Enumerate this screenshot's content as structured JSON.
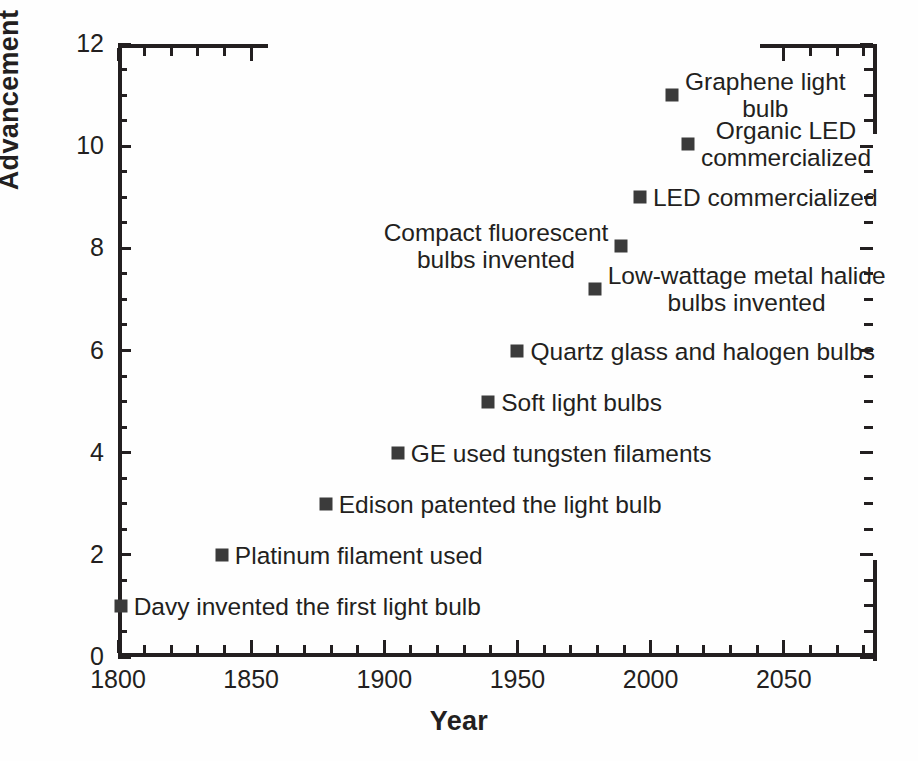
{
  "chart_data": {
    "type": "scatter",
    "title": "",
    "xlabel": "Year",
    "ylabel": "Advancement",
    "xlim": [
      1800,
      2085
    ],
    "ylim": [
      0,
      12
    ],
    "grid": false,
    "legend": false,
    "xticks_major": [
      1800,
      1850,
      1900,
      1950,
      2000,
      2050
    ],
    "xtick_labels": [
      "1800",
      "1850",
      "1900",
      "1950",
      "2000",
      "2050"
    ],
    "xtick_minor_step": 10,
    "yticks_major": [
      0,
      2,
      4,
      6,
      8,
      10,
      12
    ],
    "ytick_labels": [
      "0",
      "2",
      "4",
      "6",
      "8",
      "10",
      "12"
    ],
    "ytick_minor_step": 0.5,
    "marker": "square",
    "marker_color": "#3b3b3b",
    "axis_color": "#231f20",
    "background_color": "#ffffff",
    "points": [
      {
        "x": 1801,
        "y": 1,
        "label": "Davy invented the first light bulb",
        "label_side": "right",
        "lines": [
          "Davy invented the first light bulb"
        ]
      },
      {
        "x": 1839,
        "y": 2,
        "label": "Platinum filament used",
        "label_side": "right",
        "lines": [
          "Platinum filament used"
        ]
      },
      {
        "x": 1878,
        "y": 3,
        "label": "Edison patented the light bulb",
        "label_side": "right",
        "lines": [
          "Edison patented the light bulb"
        ]
      },
      {
        "x": 1905,
        "y": 4,
        "label": "GE used tungsten filaments",
        "label_side": "right",
        "lines": [
          "GE used tungsten filaments"
        ]
      },
      {
        "x": 1939,
        "y": 5,
        "label": "Soft light bulbs",
        "label_side": "right",
        "lines": [
          "Soft light bulbs"
        ]
      },
      {
        "x": 1950,
        "y": 6,
        "label": "Quartz glass and halogen bulbs",
        "label_side": "right",
        "lines": [
          "Quartz glass and halogen bulbs"
        ]
      },
      {
        "x": 1979,
        "y": 7.2,
        "label": "Low-wattage metal halide bulbs invented",
        "label_side": "right",
        "lines": [
          "Low-wattage metal halide",
          "bulbs invented"
        ]
      },
      {
        "x": 1989,
        "y": 8.05,
        "label": "Compact fluorescent bulbs invented",
        "label_side": "left",
        "lines": [
          "Compact fluorescent",
          "bulbs invented"
        ]
      },
      {
        "x": 1996,
        "y": 9,
        "label": "LED commercialized",
        "label_side": "right",
        "lines": [
          "LED commercialized"
        ]
      },
      {
        "x": 2014,
        "y": 10.05,
        "label": "Organic LED commercialized",
        "label_side": "right",
        "lines": [
          "Organic LED",
          "commercialized"
        ]
      },
      {
        "x": 2008,
        "y": 11,
        "label": "Graphene light bulb",
        "label_side": "right",
        "lines": [
          "Graphene light",
          "bulb"
        ]
      }
    ]
  }
}
